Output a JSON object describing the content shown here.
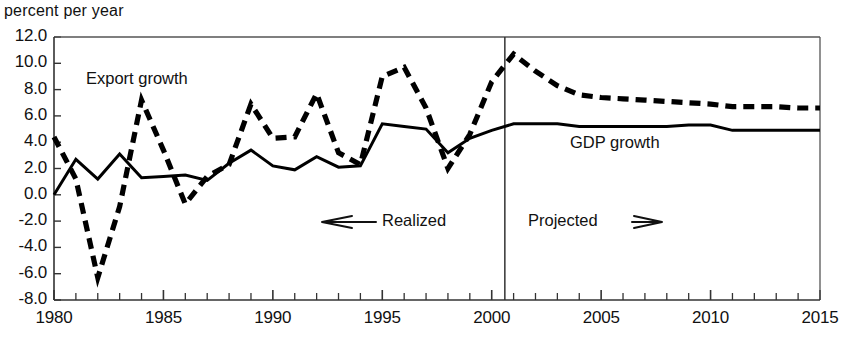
{
  "chart_data": {
    "type": "line",
    "title": "",
    "subtitle": "",
    "ylabel": "percent per year",
    "xlabel": "",
    "ylim": [
      -8.0,
      12.0
    ],
    "xlim": [
      1980,
      2015
    ],
    "grid": false,
    "legend_position": "inline-annotations",
    "y_ticks": [
      "12.0",
      "10.0",
      "8.0",
      "6.0",
      "4.0",
      "2.0",
      "0.0",
      "-2.0",
      "-4.0",
      "-6.0",
      "-8.0"
    ],
    "y_tick_values": [
      12,
      10,
      8,
      6,
      4,
      2,
      0,
      -2,
      -4,
      -6,
      -8
    ],
    "x_ticks": [
      "1980",
      "1985",
      "1990",
      "1995",
      "2000",
      "2005",
      "2010",
      "2015"
    ],
    "x_tick_values": [
      1980,
      1985,
      1990,
      1995,
      2000,
      2005,
      2010,
      2015
    ],
    "x_minor_tick_step": 1,
    "x": [
      1980,
      1981,
      1982,
      1983,
      1984,
      1985,
      1986,
      1987,
      1988,
      1989,
      1990,
      1991,
      1992,
      1993,
      1994,
      1995,
      1996,
      1997,
      1998,
      1999,
      2000,
      2001,
      2002,
      2003,
      2004,
      2005,
      2006,
      2007,
      2008,
      2009,
      2010,
      2011,
      2012,
      2013,
      2014,
      2015
    ],
    "series": [
      {
        "name": "Export growth",
        "style": "dashed",
        "color": "#000000",
        "values": [
          4.4,
          1.2,
          -6.3,
          -0.9,
          7.2,
          3.4,
          -0.7,
          1.4,
          2.3,
          6.9,
          4.3,
          4.4,
          7.7,
          3.2,
          2.3,
          9.0,
          9.7,
          6.6,
          2.0,
          4.6,
          8.6,
          10.7,
          9.4,
          8.3,
          7.6,
          7.4,
          7.3,
          7.2,
          7.1,
          7.0,
          6.9,
          6.7,
          6.7,
          6.7,
          6.6,
          6.6
        ]
      },
      {
        "name": "GDP growth",
        "style": "solid",
        "color": "#000000",
        "values": [
          0.0,
          2.7,
          1.2,
          3.1,
          1.3,
          1.4,
          1.5,
          1.1,
          2.4,
          3.4,
          2.2,
          1.9,
          2.9,
          2.1,
          2.2,
          5.4,
          5.2,
          5.0,
          3.2,
          4.3,
          4.9,
          5.4,
          5.4,
          5.4,
          5.2,
          5.2,
          5.2,
          5.2,
          5.2,
          5.3,
          5.3,
          4.9,
          4.9,
          4.9,
          4.9,
          4.9
        ]
      }
    ],
    "annotations": [
      {
        "name": "export-growth-label",
        "text": "Export growth",
        "x_px": 86,
        "y_px": 80
      },
      {
        "name": "gdp-growth-label",
        "text": "GDP growth",
        "x_px": 570,
        "y_px": 144
      },
      {
        "name": "realized-label",
        "text": "⟵  Realized",
        "x_px": 318,
        "y_px": 222
      },
      {
        "name": "projected-label",
        "text": "Projected  ⟹",
        "x_px": 528,
        "y_px": 222
      }
    ],
    "divider": {
      "name": "realized-projected-divider",
      "x_value": 2000.6,
      "label_left": "Realized",
      "label_right": "Projected"
    }
  },
  "axis": {
    "y_axis_title": "percent per year"
  }
}
